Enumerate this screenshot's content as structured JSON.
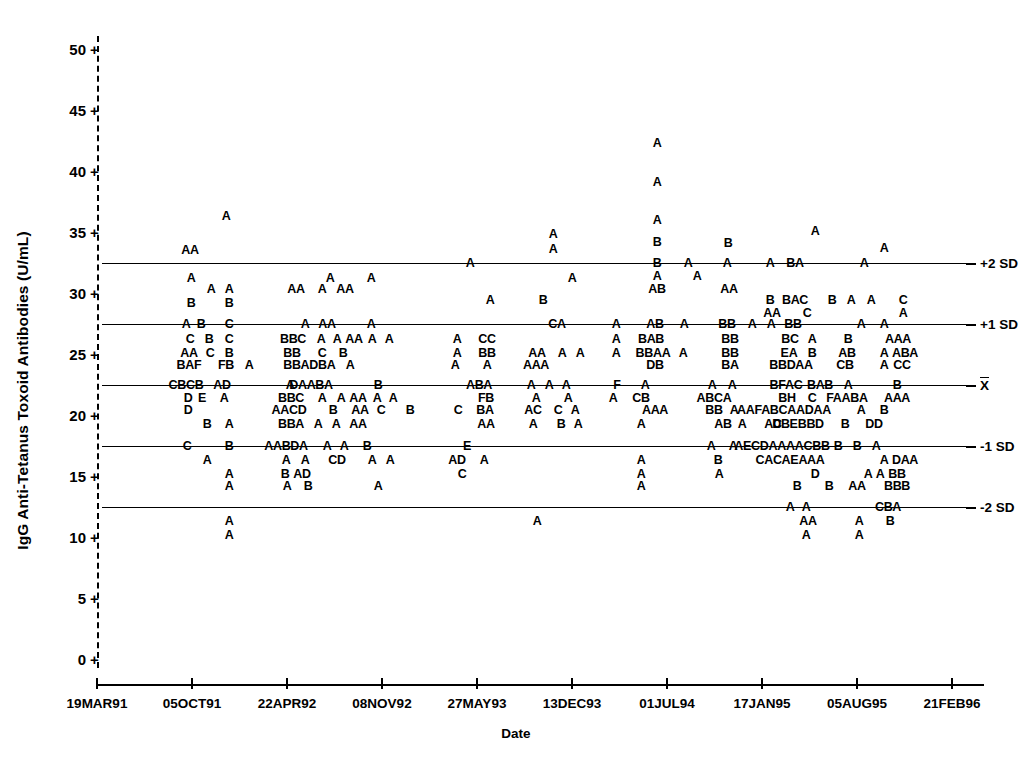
{
  "chart_data": {
    "type": "scatter",
    "title": "",
    "xlabel": "Date",
    "ylabel": "IgG Anti-Tetanus Toxoid Antibodies (U/mL)",
    "ylim": [
      0,
      51
    ],
    "yticks": [
      0,
      5,
      10,
      15,
      20,
      25,
      30,
      35,
      40,
      45,
      50
    ],
    "ytick_labels": [
      "0",
      "5",
      "10",
      "15",
      "20",
      "25",
      "30",
      "35",
      "40",
      "45",
      "50"
    ],
    "xtick_labels": [
      "19MAR91",
      "05OCT91",
      "22APR92",
      "08NOV92",
      "27MAY93",
      "13DEC93",
      "01JUL94",
      "17JAN95",
      "05AUG95",
      "21FEB96"
    ],
    "grid": false,
    "legend": "none",
    "marker_note": "Letter codes A-H denote number of coincident observations: A=1, B=2, C=3, D=4, E=5, F=6, G=7, H=8",
    "reference_lines": [
      {
        "label": "+2 SD",
        "value": 32.5
      },
      {
        "label": "+1 SD",
        "value": 27.5
      },
      {
        "label": "X̄",
        "value": 22.5
      },
      {
        "label": "-1 SD",
        "value": 17.5
      },
      {
        "label": "-2 SD",
        "value": 12.5
      }
    ],
    "points": [
      {
        "x": 226,
        "y": 36.3,
        "t": "A"
      },
      {
        "x": 190,
        "y": 33.5,
        "t": "AA"
      },
      {
        "x": 553,
        "y": 34.8,
        "t": "A"
      },
      {
        "x": 553,
        "y": 33.6,
        "t": "A"
      },
      {
        "x": 657,
        "y": 42.3,
        "t": "A"
      },
      {
        "x": 657,
        "y": 39.1,
        "t": "A"
      },
      {
        "x": 657,
        "y": 36.0,
        "t": "A"
      },
      {
        "x": 657,
        "y": 34.2,
        "t": "B"
      },
      {
        "x": 728,
        "y": 34.1,
        "t": "B"
      },
      {
        "x": 815,
        "y": 35.1,
        "t": "A"
      },
      {
        "x": 884,
        "y": 33.7,
        "t": "A"
      },
      {
        "x": 657,
        "y": 32.5,
        "t": "B"
      },
      {
        "x": 688,
        "y": 32.5,
        "t": "A"
      },
      {
        "x": 727,
        "y": 32.5,
        "t": "A"
      },
      {
        "x": 770,
        "y": 32.5,
        "t": "A"
      },
      {
        "x": 795,
        "y": 32.5,
        "t": "BA"
      },
      {
        "x": 864,
        "y": 32.5,
        "t": "A"
      },
      {
        "x": 470,
        "y": 32.5,
        "t": "A"
      },
      {
        "x": 191,
        "y": 31.2,
        "t": "A"
      },
      {
        "x": 211,
        "y": 30.3,
        "t": "A"
      },
      {
        "x": 229,
        "y": 30.3,
        "t": "A"
      },
      {
        "x": 296,
        "y": 30.3,
        "t": "AA"
      },
      {
        "x": 345,
        "y": 30.3,
        "t": "AA"
      },
      {
        "x": 330,
        "y": 31.2,
        "t": "A"
      },
      {
        "x": 371,
        "y": 31.2,
        "t": "A"
      },
      {
        "x": 572,
        "y": 31.2,
        "t": "A"
      },
      {
        "x": 729,
        "y": 30.3,
        "t": "AA"
      },
      {
        "x": 657,
        "y": 30.3,
        "t": "AB"
      },
      {
        "x": 657,
        "y": 31.4,
        "t": "A"
      },
      {
        "x": 697,
        "y": 31.4,
        "t": "A"
      },
      {
        "x": 770,
        "y": 29.4,
        "t": "B"
      },
      {
        "x": 795,
        "y": 29.4,
        "t": "BAC"
      },
      {
        "x": 832,
        "y": 29.4,
        "t": "B"
      },
      {
        "x": 851,
        "y": 29.4,
        "t": "A"
      },
      {
        "x": 871,
        "y": 29.4,
        "t": "A"
      },
      {
        "x": 903,
        "y": 29.4,
        "t": "C"
      },
      {
        "x": 772,
        "y": 28.4,
        "t": "AA"
      },
      {
        "x": 807,
        "y": 28.4,
        "t": "C"
      },
      {
        "x": 903,
        "y": 28.4,
        "t": "A"
      },
      {
        "x": 191,
        "y": 29.2,
        "t": "B"
      },
      {
        "x": 229,
        "y": 29.2,
        "t": "B"
      },
      {
        "x": 322,
        "y": 30.3,
        "t": "A"
      },
      {
        "x": 490,
        "y": 29.4,
        "t": "A"
      },
      {
        "x": 543,
        "y": 29.4,
        "t": "B"
      },
      {
        "x": 186,
        "y": 27.5,
        "t": "A"
      },
      {
        "x": 201,
        "y": 27.5,
        "t": "B"
      },
      {
        "x": 229,
        "y": 27.5,
        "t": "C"
      },
      {
        "x": 305,
        "y": 27.5,
        "t": "A"
      },
      {
        "x": 327,
        "y": 27.5,
        "t": "AA"
      },
      {
        "x": 371,
        "y": 27.5,
        "t": "A"
      },
      {
        "x": 557,
        "y": 27.5,
        "t": "CA"
      },
      {
        "x": 616,
        "y": 27.5,
        "t": "A"
      },
      {
        "x": 655,
        "y": 27.5,
        "t": "AB"
      },
      {
        "x": 684,
        "y": 27.5,
        "t": "A"
      },
      {
        "x": 727,
        "y": 27.5,
        "t": "BB"
      },
      {
        "x": 752,
        "y": 27.5,
        "t": "A"
      },
      {
        "x": 771,
        "y": 27.5,
        "t": "A"
      },
      {
        "x": 793,
        "y": 27.5,
        "t": "BB"
      },
      {
        "x": 861,
        "y": 27.5,
        "t": "A"
      },
      {
        "x": 884,
        "y": 27.5,
        "t": "A"
      },
      {
        "x": 190,
        "y": 26.2,
        "t": "C"
      },
      {
        "x": 209,
        "y": 26.2,
        "t": "B"
      },
      {
        "x": 229,
        "y": 26.2,
        "t": "C"
      },
      {
        "x": 293,
        "y": 26.2,
        "t": "BBC"
      },
      {
        "x": 321,
        "y": 26.2,
        "t": "A"
      },
      {
        "x": 337,
        "y": 26.2,
        "t": "A"
      },
      {
        "x": 354,
        "y": 26.2,
        "t": "AA"
      },
      {
        "x": 372,
        "y": 26.2,
        "t": "A"
      },
      {
        "x": 389,
        "y": 26.2,
        "t": "A"
      },
      {
        "x": 457,
        "y": 26.2,
        "t": "A"
      },
      {
        "x": 487,
        "y": 26.2,
        "t": "CC"
      },
      {
        "x": 616,
        "y": 26.2,
        "t": "A"
      },
      {
        "x": 651,
        "y": 26.2,
        "t": "BAB"
      },
      {
        "x": 730,
        "y": 26.2,
        "t": "BB"
      },
      {
        "x": 790,
        "y": 26.2,
        "t": "BC"
      },
      {
        "x": 812,
        "y": 26.2,
        "t": "A"
      },
      {
        "x": 848,
        "y": 26.2,
        "t": "B"
      },
      {
        "x": 898,
        "y": 26.2,
        "t": "AAA"
      },
      {
        "x": 189,
        "y": 25.1,
        "t": "AA"
      },
      {
        "x": 210,
        "y": 25.1,
        "t": "C"
      },
      {
        "x": 229,
        "y": 25.1,
        "t": "B"
      },
      {
        "x": 292,
        "y": 25.1,
        "t": "BB"
      },
      {
        "x": 322,
        "y": 25.1,
        "t": "C"
      },
      {
        "x": 343,
        "y": 25.1,
        "t": "B"
      },
      {
        "x": 457,
        "y": 25.1,
        "t": "A"
      },
      {
        "x": 487,
        "y": 25.1,
        "t": "BB"
      },
      {
        "x": 537,
        "y": 25.1,
        "t": "AA"
      },
      {
        "x": 562,
        "y": 25.1,
        "t": "A"
      },
      {
        "x": 580,
        "y": 25.1,
        "t": "A"
      },
      {
        "x": 616,
        "y": 25.1,
        "t": "A"
      },
      {
        "x": 653,
        "y": 25.1,
        "t": "BBAA"
      },
      {
        "x": 683,
        "y": 25.1,
        "t": "A"
      },
      {
        "x": 730,
        "y": 25.1,
        "t": "BB"
      },
      {
        "x": 789,
        "y": 25.1,
        "t": "EA"
      },
      {
        "x": 812,
        "y": 25.1,
        "t": "B"
      },
      {
        "x": 847,
        "y": 25.1,
        "t": "AB"
      },
      {
        "x": 884,
        "y": 25.1,
        "t": "A"
      },
      {
        "x": 905,
        "y": 25.1,
        "t": "ABA"
      },
      {
        "x": 189,
        "y": 24.1,
        "t": "BAF"
      },
      {
        "x": 226,
        "y": 24.1,
        "t": "FB"
      },
      {
        "x": 249,
        "y": 24.1,
        "t": "A"
      },
      {
        "x": 292,
        "y": 24.1,
        "t": "BB"
      },
      {
        "x": 318,
        "y": 24.1,
        "t": "ADBA"
      },
      {
        "x": 350,
        "y": 24.1,
        "t": "A"
      },
      {
        "x": 455,
        "y": 24.1,
        "t": "A"
      },
      {
        "x": 487,
        "y": 24.1,
        "t": "A"
      },
      {
        "x": 536,
        "y": 24.1,
        "t": "AAA"
      },
      {
        "x": 655,
        "y": 24.1,
        "t": "DB"
      },
      {
        "x": 730,
        "y": 24.1,
        "t": "BA"
      },
      {
        "x": 791,
        "y": 24.1,
        "t": "BBDAA"
      },
      {
        "x": 845,
        "y": 24.1,
        "t": "CB"
      },
      {
        "x": 884,
        "y": 24.1,
        "t": "A"
      },
      {
        "x": 902,
        "y": 24.1,
        "t": "CC"
      },
      {
        "x": 186,
        "y": 22.5,
        "t": "CBCB"
      },
      {
        "x": 222,
        "y": 22.5,
        "t": "AD"
      },
      {
        "x": 290,
        "y": 22.5,
        "t": "A"
      },
      {
        "x": 311,
        "y": 22.5,
        "t": "DAABA"
      },
      {
        "x": 378,
        "y": 22.5,
        "t": "B"
      },
      {
        "x": 479,
        "y": 22.5,
        "t": "ABA"
      },
      {
        "x": 531,
        "y": 22.5,
        "t": "A"
      },
      {
        "x": 549,
        "y": 22.5,
        "t": "A"
      },
      {
        "x": 566,
        "y": 22.5,
        "t": "A"
      },
      {
        "x": 617,
        "y": 22.5,
        "t": "F"
      },
      {
        "x": 645,
        "y": 22.5,
        "t": "A"
      },
      {
        "x": 712,
        "y": 22.5,
        "t": "A"
      },
      {
        "x": 732,
        "y": 22.5,
        "t": "A"
      },
      {
        "x": 786,
        "y": 22.5,
        "t": "BFAC"
      },
      {
        "x": 820,
        "y": 22.5,
        "t": "BAB"
      },
      {
        "x": 848,
        "y": 22.5,
        "t": "A"
      },
      {
        "x": 897,
        "y": 22.5,
        "t": "B"
      },
      {
        "x": 188,
        "y": 21.4,
        "t": "D"
      },
      {
        "x": 202,
        "y": 21.4,
        "t": "E"
      },
      {
        "x": 224,
        "y": 21.4,
        "t": "A"
      },
      {
        "x": 291,
        "y": 21.4,
        "t": "BBC"
      },
      {
        "x": 322,
        "y": 21.4,
        "t": "A"
      },
      {
        "x": 341,
        "y": 21.4,
        "t": "A"
      },
      {
        "x": 358,
        "y": 21.4,
        "t": "AA"
      },
      {
        "x": 377,
        "y": 21.4,
        "t": "A"
      },
      {
        "x": 393,
        "y": 21.4,
        "t": "A"
      },
      {
        "x": 486,
        "y": 21.4,
        "t": "FB"
      },
      {
        "x": 536,
        "y": 21.4,
        "t": "A"
      },
      {
        "x": 568,
        "y": 21.4,
        "t": "A"
      },
      {
        "x": 613,
        "y": 21.4,
        "t": "A"
      },
      {
        "x": 641,
        "y": 21.4,
        "t": "CB"
      },
      {
        "x": 714,
        "y": 21.4,
        "t": "ABCA"
      },
      {
        "x": 787,
        "y": 21.4,
        "t": "BH"
      },
      {
        "x": 812,
        "y": 21.4,
        "t": "C"
      },
      {
        "x": 847,
        "y": 21.4,
        "t": "FAABA"
      },
      {
        "x": 897,
        "y": 21.4,
        "t": "AAA"
      },
      {
        "x": 188,
        "y": 20.4,
        "t": "D"
      },
      {
        "x": 289,
        "y": 20.4,
        "t": "AACD"
      },
      {
        "x": 333,
        "y": 20.4,
        "t": "B"
      },
      {
        "x": 360,
        "y": 20.4,
        "t": "AA"
      },
      {
        "x": 381,
        "y": 20.4,
        "t": "C"
      },
      {
        "x": 410,
        "y": 20.4,
        "t": "B"
      },
      {
        "x": 458,
        "y": 20.4,
        "t": "C"
      },
      {
        "x": 485,
        "y": 20.4,
        "t": "BA"
      },
      {
        "x": 533,
        "y": 20.4,
        "t": "AC"
      },
      {
        "x": 558,
        "y": 20.4,
        "t": "C"
      },
      {
        "x": 575,
        "y": 20.4,
        "t": "A"
      },
      {
        "x": 655,
        "y": 20.4,
        "t": "AAA"
      },
      {
        "x": 714,
        "y": 20.4,
        "t": "BB"
      },
      {
        "x": 734,
        "y": 20.4,
        "t": "A"
      },
      {
        "x": 784,
        "y": 20.4,
        "t": "AAFABCAADAA"
      },
      {
        "x": 861,
        "y": 20.4,
        "t": "A"
      },
      {
        "x": 884,
        "y": 20.4,
        "t": "B"
      },
      {
        "x": 291,
        "y": 19.3,
        "t": "BBA"
      },
      {
        "x": 318,
        "y": 19.3,
        "t": "A"
      },
      {
        "x": 336,
        "y": 19.3,
        "t": "A"
      },
      {
        "x": 358,
        "y": 19.3,
        "t": "AA"
      },
      {
        "x": 486,
        "y": 19.3,
        "t": "AA"
      },
      {
        "x": 533,
        "y": 19.3,
        "t": "A"
      },
      {
        "x": 561,
        "y": 19.3,
        "t": "B"
      },
      {
        "x": 578,
        "y": 19.3,
        "t": "A"
      },
      {
        "x": 641,
        "y": 19.3,
        "t": "A"
      },
      {
        "x": 723,
        "y": 19.3,
        "t": "AB"
      },
      {
        "x": 742,
        "y": 19.3,
        "t": "A"
      },
      {
        "x": 773,
        "y": 19.3,
        "t": "AC"
      },
      {
        "x": 798,
        "y": 19.3,
        "t": "DBEBBD"
      },
      {
        "x": 845,
        "y": 19.3,
        "t": "B"
      },
      {
        "x": 874,
        "y": 19.3,
        "t": "DD"
      },
      {
        "x": 207,
        "y": 19.3,
        "t": "B"
      },
      {
        "x": 229,
        "y": 19.3,
        "t": "A"
      },
      {
        "x": 187,
        "y": 17.5,
        "t": "C"
      },
      {
        "x": 229,
        "y": 17.5,
        "t": "B"
      },
      {
        "x": 286,
        "y": 17.5,
        "t": "AABDA"
      },
      {
        "x": 327,
        "y": 17.5,
        "t": "A"
      },
      {
        "x": 344,
        "y": 17.5,
        "t": "A"
      },
      {
        "x": 367,
        "y": 17.5,
        "t": "B"
      },
      {
        "x": 467,
        "y": 17.5,
        "t": "E"
      },
      {
        "x": 711,
        "y": 17.5,
        "t": "A"
      },
      {
        "x": 733,
        "y": 17.5,
        "t": "A"
      },
      {
        "x": 782,
        "y": 17.5,
        "t": "AECDAAAACBB"
      },
      {
        "x": 838,
        "y": 17.5,
        "t": "B"
      },
      {
        "x": 857,
        "y": 17.5,
        "t": "B"
      },
      {
        "x": 876,
        "y": 17.5,
        "t": "A"
      },
      {
        "x": 207,
        "y": 16.3,
        "t": "A"
      },
      {
        "x": 286,
        "y": 16.3,
        "t": "A"
      },
      {
        "x": 305,
        "y": 16.3,
        "t": "A"
      },
      {
        "x": 337,
        "y": 16.3,
        "t": "CD"
      },
      {
        "x": 372,
        "y": 16.3,
        "t": "A"
      },
      {
        "x": 390,
        "y": 16.3,
        "t": "A"
      },
      {
        "x": 457,
        "y": 16.3,
        "t": "AD"
      },
      {
        "x": 484,
        "y": 16.3,
        "t": "A"
      },
      {
        "x": 641,
        "y": 16.3,
        "t": "A"
      },
      {
        "x": 718,
        "y": 16.3,
        "t": "B"
      },
      {
        "x": 790,
        "y": 16.3,
        "t": "CACAEAAA"
      },
      {
        "x": 884,
        "y": 16.3,
        "t": "A"
      },
      {
        "x": 905,
        "y": 16.3,
        "t": "DAA"
      },
      {
        "x": 285,
        "y": 15.2,
        "t": "B"
      },
      {
        "x": 302,
        "y": 15.2,
        "t": "AD"
      },
      {
        "x": 229,
        "y": 15.2,
        "t": "A"
      },
      {
        "x": 462,
        "y": 15.2,
        "t": "C"
      },
      {
        "x": 641,
        "y": 15.2,
        "t": "A"
      },
      {
        "x": 719,
        "y": 15.2,
        "t": "A"
      },
      {
        "x": 815,
        "y": 15.2,
        "t": "D"
      },
      {
        "x": 868,
        "y": 15.2,
        "t": "A"
      },
      {
        "x": 880,
        "y": 15.2,
        "t": "A"
      },
      {
        "x": 897,
        "y": 15.2,
        "t": "BB"
      },
      {
        "x": 229,
        "y": 14.2,
        "t": "A"
      },
      {
        "x": 287,
        "y": 14.2,
        "t": "A"
      },
      {
        "x": 308,
        "y": 14.2,
        "t": "B"
      },
      {
        "x": 378,
        "y": 14.2,
        "t": "A"
      },
      {
        "x": 641,
        "y": 14.2,
        "t": "A"
      },
      {
        "x": 797,
        "y": 14.2,
        "t": "B"
      },
      {
        "x": 829,
        "y": 14.2,
        "t": "B"
      },
      {
        "x": 857,
        "y": 14.2,
        "t": "AA"
      },
      {
        "x": 897,
        "y": 14.2,
        "t": "BBB"
      },
      {
        "x": 790,
        "y": 12.5,
        "t": "A"
      },
      {
        "x": 806,
        "y": 12.5,
        "t": "A"
      },
      {
        "x": 888,
        "y": 12.5,
        "t": "CBA"
      },
      {
        "x": 229,
        "y": 11.3,
        "t": "A"
      },
      {
        "x": 537,
        "y": 11.3,
        "t": "A"
      },
      {
        "x": 808,
        "y": 11.3,
        "t": "AA"
      },
      {
        "x": 859,
        "y": 11.3,
        "t": "A"
      },
      {
        "x": 890,
        "y": 11.3,
        "t": "B"
      },
      {
        "x": 229,
        "y": 10.2,
        "t": "A"
      },
      {
        "x": 806,
        "y": 10.2,
        "t": "A"
      },
      {
        "x": 859,
        "y": 10.2,
        "t": "A"
      }
    ]
  }
}
